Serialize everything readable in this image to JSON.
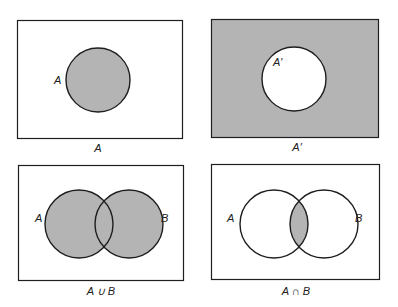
{
  "colors": {
    "shade": "#b4b4b4",
    "stroke": "#1e1e1e",
    "background": "#ffffff"
  },
  "panels": [
    {
      "caption": "A",
      "labels": {
        "A": "A"
      },
      "shaded": "A"
    },
    {
      "caption": "A′",
      "labels": {
        "A": "A′"
      },
      "shaded": "complement of A"
    },
    {
      "caption": "A ∪ B",
      "labels": {
        "A": "A",
        "B": "B"
      },
      "shaded": "union"
    },
    {
      "caption": "A ∩ B",
      "labels": {
        "A": "A",
        "B": "B"
      },
      "shaded": "intersection"
    }
  ]
}
